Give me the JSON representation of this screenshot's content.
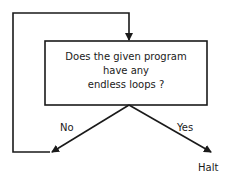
{
  "diagram": {
    "type": "flowchart",
    "decision_box": {
      "lines": [
        "Does the given program",
        "have any",
        "endless loops ?"
      ]
    },
    "branches": {
      "no_label": "No",
      "yes_label": "Yes"
    },
    "terminal": {
      "label": "Halt"
    },
    "colors": {
      "stroke": "#1a1a1a",
      "background": "#ffffff"
    }
  }
}
